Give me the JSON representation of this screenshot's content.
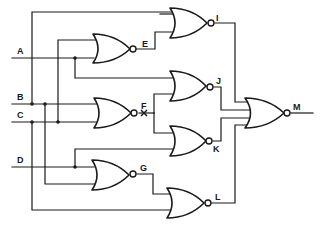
{
  "diagram": {
    "type": "logic-circuit",
    "gate_type": "NOR",
    "inputs": [
      {
        "id": "A",
        "label": "A"
      },
      {
        "id": "B",
        "label": "B"
      },
      {
        "id": "C",
        "label": "C"
      },
      {
        "id": "D",
        "label": "D"
      }
    ],
    "gates": [
      {
        "id": "E",
        "label": "E",
        "type": "NOR",
        "inputs": [
          "C",
          "A"
        ]
      },
      {
        "id": "F",
        "label": "F",
        "type": "NOR",
        "inputs": [
          "B",
          "C"
        ],
        "fault_marked": true
      },
      {
        "id": "G",
        "label": "G",
        "type": "NOR",
        "inputs": [
          "D",
          "B"
        ]
      },
      {
        "id": "I",
        "label": "I",
        "type": "NOR",
        "inputs": [
          "B",
          "E"
        ]
      },
      {
        "id": "J",
        "label": "J",
        "type": "NOR",
        "inputs": [
          "A",
          "F"
        ]
      },
      {
        "id": "K",
        "label": "K",
        "type": "NOR",
        "inputs": [
          "F",
          "D"
        ]
      },
      {
        "id": "L",
        "label": "L",
        "type": "NOR",
        "inputs": [
          "G",
          "C"
        ]
      },
      {
        "id": "M",
        "label": "M",
        "type": "NOR",
        "inputs": [
          "I",
          "J",
          "K",
          "L"
        ],
        "output": true
      }
    ]
  }
}
